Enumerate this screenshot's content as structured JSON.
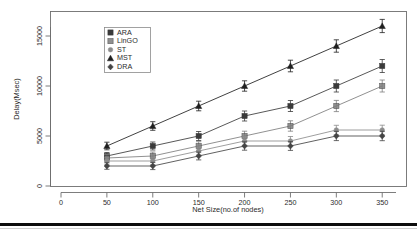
{
  "figure": {
    "background_color": "#ffffff",
    "frame_color": "#6e6e6e",
    "bottom_rule_color": "#0d0d0d"
  },
  "chart_data": {
    "type": "line",
    "title": "",
    "xlabel": "Net Size(no.of nodes)",
    "ylabel": "Delay(Msec)",
    "x": [
      50,
      100,
      150,
      200,
      250,
      300,
      350
    ],
    "xlim": [
      0,
      365
    ],
    "ylim": [
      0,
      16800
    ],
    "xticks": [
      0,
      50,
      100,
      150,
      200,
      250,
      300,
      350
    ],
    "xtick_labels": [
      "0",
      "50",
      "100",
      "150",
      "200",
      "250",
      "300",
      "350"
    ],
    "yticks": [
      0,
      5000,
      10000,
      15000
    ],
    "ytick_labels": [
      "0",
      "5000",
      "10000",
      "15000"
    ],
    "grid": false,
    "legend_position": "upper-left-inside",
    "error_bars": true,
    "series": [
      {
        "name": "ARA",
        "marker": "square",
        "color": "#3a3a3a",
        "values": [
          3000,
          4000,
          5000,
          7000,
          8000,
          10000,
          12000
        ],
        "yerr": [
          350,
          400,
          450,
          500,
          550,
          600,
          650
        ]
      },
      {
        "name": "LinGO",
        "marker": "square-hatched",
        "color": "#7d7d7d",
        "values": [
          2800,
          3000,
          4000,
          5000,
          6000,
          8000,
          10000
        ],
        "yerr": [
          350,
          400,
          430,
          480,
          520,
          560,
          600
        ]
      },
      {
        "name": "ST",
        "marker": "dot",
        "color": "#8c8c8c",
        "values": [
          2500,
          2500,
          3500,
          4500,
          4500,
          5600,
          5600
        ],
        "yerr": [
          330,
          360,
          400,
          430,
          450,
          470,
          480
        ]
      },
      {
        "name": "MST",
        "marker": "triangle",
        "color": "#1f1f1f",
        "values": [
          4000,
          6000,
          8000,
          10000,
          12000,
          14000,
          16000
        ],
        "yerr": [
          380,
          430,
          480,
          520,
          580,
          620,
          660
        ]
      },
      {
        "name": "DRA",
        "marker": "diamond",
        "color": "#444444",
        "values": [
          2000,
          2000,
          3000,
          4000,
          4000,
          5000,
          5000
        ],
        "yerr": [
          330,
          360,
          390,
          420,
          440,
          460,
          470
        ]
      }
    ]
  },
  "legend": {
    "items": [
      {
        "label": "ARA"
      },
      {
        "label": "LinGO"
      },
      {
        "label": "ST"
      },
      {
        "label": "MST"
      },
      {
        "label": "DRA"
      }
    ]
  }
}
